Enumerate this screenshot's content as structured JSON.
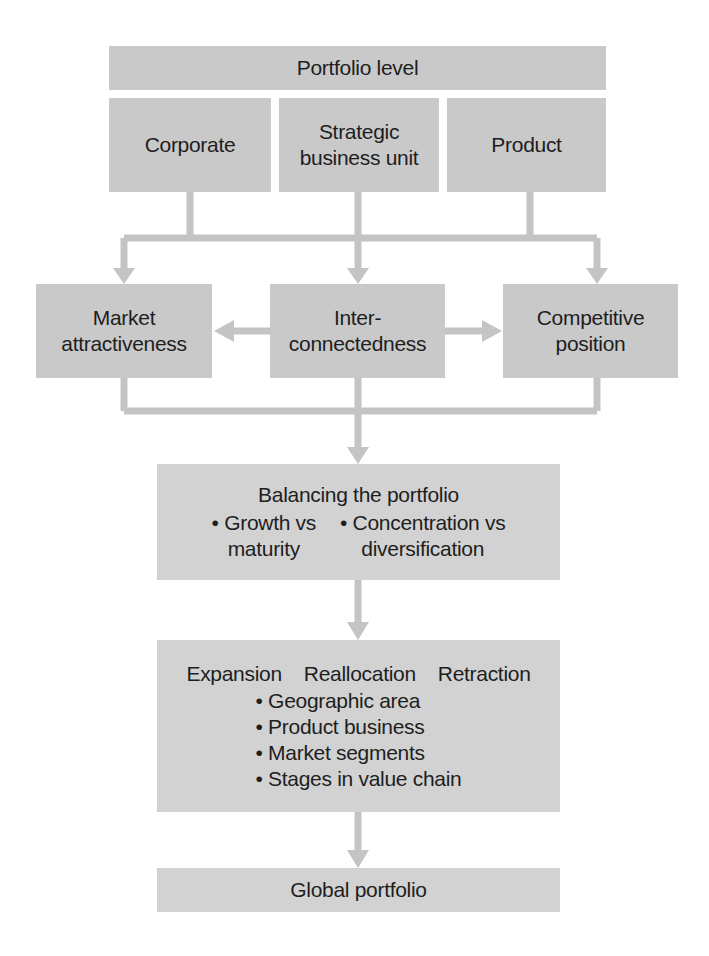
{
  "diagram": {
    "portfolio_level": "Portfolio level",
    "levels": [
      {
        "label_line1": "Corporate",
        "label_line2": ""
      },
      {
        "label_line1": "Strategic",
        "label_line2": "business unit"
      },
      {
        "label_line1": "Product",
        "label_line2": ""
      }
    ],
    "factors": [
      {
        "line1": "Market",
        "line2": "attractiveness"
      },
      {
        "line1": "Inter-",
        "line2": "connectedness"
      },
      {
        "line1": "Competitive",
        "line2": "position"
      }
    ],
    "balancing": {
      "title": "Balancing the portfolio",
      "items": [
        {
          "line1": "• Growth vs",
          "line2": "maturity"
        },
        {
          "line1": "• Concentration vs",
          "line2": "diversification"
        }
      ]
    },
    "actions": {
      "headings": [
        "Expansion",
        "Reallocation",
        "Retraction"
      ],
      "items": [
        "• Geographic area",
        "• Product business",
        "• Market segments",
        "• Stages in value chain"
      ]
    },
    "output": "Global portfolio"
  },
  "colors": {
    "box": "#c9c9c9",
    "arrow": "#c4c4c4",
    "text": "#1e1e1e"
  }
}
